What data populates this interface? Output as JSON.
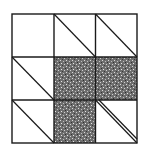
{
  "diagram": {
    "type": "quilt-block-grid",
    "rows": 3,
    "cols": 3,
    "colors": {
      "background": "#ffffff",
      "stroke": "#1a1a1a",
      "fill": "#6e6e6e"
    },
    "cells": [
      {
        "row": 0,
        "col": 0,
        "content": "empty"
      },
      {
        "row": 0,
        "col": 1,
        "content": "diagonal"
      },
      {
        "row": 0,
        "col": 2,
        "content": "diagonal"
      },
      {
        "row": 1,
        "col": 0,
        "content": "diagonal"
      },
      {
        "row": 1,
        "col": 1,
        "content": "shaded"
      },
      {
        "row": 1,
        "col": 2,
        "content": "shaded"
      },
      {
        "row": 2,
        "col": 0,
        "content": "diagonal"
      },
      {
        "row": 2,
        "col": 1,
        "content": "shaded"
      },
      {
        "row": 2,
        "col": 2,
        "content": "double-diagonal"
      }
    ]
  }
}
